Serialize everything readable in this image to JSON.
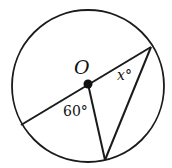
{
  "diagram": {
    "type": "circle-geometry",
    "circle": {
      "cx": 88,
      "cy": 86,
      "r": 76,
      "stroke": "#1a1a1a"
    },
    "center": {
      "x": 88,
      "y": 84,
      "label": "O"
    },
    "points": {
      "left": {
        "x": 21,
        "y": 125
      },
      "upper_right": {
        "x": 151,
        "y": 47
      },
      "bottom": {
        "x": 105,
        "y": 160
      }
    },
    "segments": [
      {
        "name": "diameter",
        "from": "left",
        "to": "upper_right"
      },
      {
        "name": "radius",
        "from": "center",
        "to": "bottom"
      },
      {
        "name": "chord",
        "from": "upper_right",
        "to": "bottom"
      }
    ],
    "labels": {
      "center_label": "O",
      "angle_at_center": "60°",
      "angle_at_upper_right": "x°"
    }
  }
}
